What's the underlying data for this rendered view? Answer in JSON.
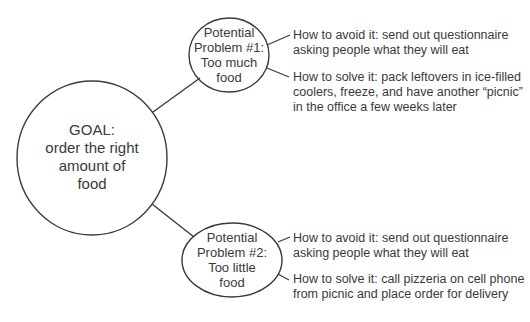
{
  "diagram": {
    "type": "mind-map",
    "goal": {
      "lines": [
        "GOAL:",
        "order the right",
        "amount of",
        "food"
      ]
    },
    "problems": [
      {
        "lines": [
          "Potential",
          "Problem #1:",
          "Too much",
          "food"
        ],
        "avoid": {
          "lines": [
            "How to avoid it: send out questionnaire",
            "asking people what they will eat"
          ]
        },
        "solve": {
          "lines": [
            "How to solve it: pack leftovers in ice-filled",
            "coolers, freeze, and have another “picnic”",
            "in the office a few weeks later"
          ]
        }
      },
      {
        "lines": [
          "Potential",
          "Problem #2:",
          "Too little",
          "food"
        ],
        "avoid": {
          "lines": [
            "How to avoid it: send out questionnaire",
            "asking people what they will eat"
          ]
        },
        "solve": {
          "lines": [
            "How to solve it: call pizzeria on cell phone",
            "from picnic and place order for delivery"
          ]
        }
      }
    ],
    "colors": {
      "stroke": "#3a3a3a",
      "text": "#3a3a3a",
      "background": "#ffffff"
    }
  }
}
